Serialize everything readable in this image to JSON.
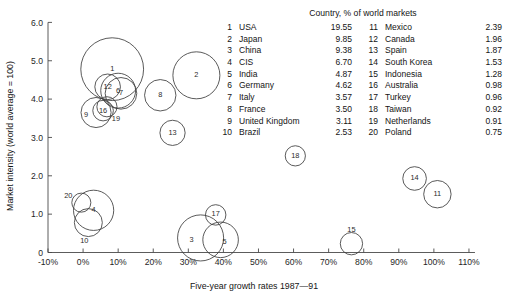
{
  "chart_data": {
    "type": "scatter",
    "title": "",
    "xlabel": "Five-year growth rates 1987—91",
    "ylabel": "Market intensity (world average = 100)",
    "xlim": [
      -10,
      110
    ],
    "ylim": [
      0,
      6.0
    ],
    "x_ticks": [
      "-10%",
      "0%",
      "10%",
      "20%",
      "30%",
      "40%",
      "50%",
      "60%",
      "70%",
      "80%",
      "90%",
      "100%",
      "110%"
    ],
    "x_tick_values": [
      -10,
      0,
      10,
      20,
      30,
      40,
      50,
      60,
      70,
      80,
      90,
      100,
      110
    ],
    "y_ticks": [
      "0",
      "1.0",
      "2.0",
      "3.0",
      "4.0",
      "5.0",
      "6.0"
    ],
    "y_tick_values": [
      0,
      1.0,
      2.0,
      3.0,
      4.0,
      5.0,
      6.0
    ],
    "grid": false,
    "legend_position": "top-right",
    "size_encoding": "bubble area = % of world markets",
    "points": [
      {
        "rank": 1,
        "label": "1",
        "country": "USA",
        "x": 8.3,
        "y": 4.78,
        "size": 19.55
      },
      {
        "rank": 2,
        "label": "2",
        "country": "Japan",
        "x": 32.3,
        "y": 4.62,
        "size": 9.85
      },
      {
        "rank": 3,
        "label": "3",
        "country": "China",
        "x": 33.5,
        "y": 0.38,
        "size": 9.38
      },
      {
        "rank": 4,
        "label": "4",
        "country": "CIS",
        "x": 3.0,
        "y": 1.1,
        "size": 6.7
      },
      {
        "rank": 5,
        "label": "5",
        "country": "India",
        "x": 39.2,
        "y": 0.33,
        "size": 4.87
      },
      {
        "rank": 6,
        "label": "6",
        "country": "Germany",
        "x": 10.0,
        "y": 4.22,
        "size": 4.62
      },
      {
        "rank": 7,
        "label": "7",
        "country": "Italy",
        "x": 10.8,
        "y": 4.15,
        "size": 3.57
      },
      {
        "rank": 8,
        "label": "8",
        "country": "France",
        "x": 22.0,
        "y": 4.1,
        "size": 3.5
      },
      {
        "rank": 9,
        "label": "9",
        "country": "United Kingdom",
        "x": 3.7,
        "y": 3.65,
        "size": 3.11
      },
      {
        "rank": 10,
        "label": "10",
        "country": "Brazil",
        "x": 1.5,
        "y": 0.78,
        "size": 2.53
      },
      {
        "rank": 11,
        "label": "11",
        "country": "Mexico",
        "x": 101.0,
        "y": 1.52,
        "size": 2.39
      },
      {
        "rank": 12,
        "label": "12",
        "country": "Canada",
        "x": 7.0,
        "y": 4.32,
        "size": 1.96
      },
      {
        "rank": 13,
        "label": "13",
        "country": "Spain",
        "x": 25.5,
        "y": 3.12,
        "size": 1.87
      },
      {
        "rank": 14,
        "label": "14",
        "country": "South Korea",
        "x": 94.5,
        "y": 1.93,
        "size": 1.53
      },
      {
        "rank": 15,
        "label": "15",
        "country": "Indonesia",
        "x": 76.5,
        "y": 0.23,
        "size": 1.28
      },
      {
        "rank": 16,
        "label": "16",
        "country": "Australia",
        "x": 5.7,
        "y": 3.7,
        "size": 0.98
      },
      {
        "rank": 17,
        "label": "17",
        "country": "Turkey",
        "x": 37.8,
        "y": 0.98,
        "size": 0.96
      },
      {
        "rank": 18,
        "label": "18",
        "country": "Taiwan",
        "x": 60.5,
        "y": 2.52,
        "size": 0.92
      },
      {
        "rank": 19,
        "label": "19",
        "country": "Netherlands",
        "x": 6.8,
        "y": 3.8,
        "size": 0.91
      },
      {
        "rank": 20,
        "label": "20",
        "country": "Poland",
        "x": -0.5,
        "y": 1.3,
        "size": 0.75
      }
    ]
  },
  "legend": {
    "title": "Country, % of world markets",
    "column_left": [
      {
        "rank": "1",
        "country": "USA",
        "value": "19.55"
      },
      {
        "rank": "2",
        "country": "Japan",
        "value": "9.85"
      },
      {
        "rank": "3",
        "country": "China",
        "value": "9.38"
      },
      {
        "rank": "4",
        "country": "CIS",
        "value": "6.70"
      },
      {
        "rank": "5",
        "country": "India",
        "value": "4.87"
      },
      {
        "rank": "6",
        "country": "Germany",
        "value": "4.62"
      },
      {
        "rank": "7",
        "country": "Italy",
        "value": "3.57"
      },
      {
        "rank": "8",
        "country": "France",
        "value": "3.50"
      },
      {
        "rank": "9",
        "country": "United Kingdom",
        "value": "3.11"
      },
      {
        "rank": "10",
        "country": "Brazil",
        "value": "2.53"
      }
    ],
    "column_right": [
      {
        "rank": "11",
        "country": "Mexico",
        "value": "2.39"
      },
      {
        "rank": "12",
        "country": "Canada",
        "value": "1.96"
      },
      {
        "rank": "13",
        "country": "Spain",
        "value": "1.87"
      },
      {
        "rank": "14",
        "country": "South Korea",
        "value": "1.53"
      },
      {
        "rank": "15",
        "country": "Indonesia",
        "value": "1.28"
      },
      {
        "rank": "16",
        "country": "Australia",
        "value": "0.98"
      },
      {
        "rank": "17",
        "country": "Turkey",
        "value": "0.96"
      },
      {
        "rank": "18",
        "country": "Taiwan",
        "value": "0.92"
      },
      {
        "rank": "19",
        "country": "Netherlands",
        "value": "0.91"
      },
      {
        "rank": "20",
        "country": "Poland",
        "value": "0.75"
      }
    ]
  },
  "colors": {
    "axis": "#4a4a4a",
    "bubble_stroke": "#3c3c3c",
    "text": "#141414",
    "background": "#ffffff"
  }
}
